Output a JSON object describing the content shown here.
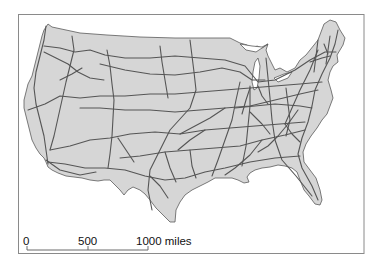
{
  "map": {
    "title": "",
    "subject": "Contiguous United States interstate highway network",
    "colors": {
      "land": "#d6d6d6",
      "highway": "#555555",
      "background": "#ffffff",
      "frame": "#8a8a8a"
    }
  },
  "scale_bar": {
    "labels": [
      "0",
      "500",
      "1000 miles"
    ],
    "values": [
      0,
      500,
      1000
    ],
    "unit": "miles"
  }
}
